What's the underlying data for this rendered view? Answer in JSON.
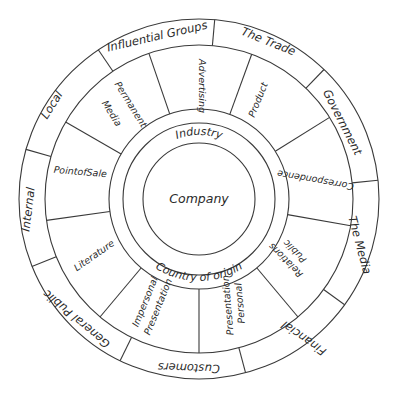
{
  "diagram": {
    "type": "concentric-wheel",
    "center": {
      "label": "Company"
    },
    "inner_ring": {
      "top_label": "Industry",
      "bottom_label": "Country of origin"
    },
    "middle_ring": {
      "segments": [
        {
          "label": "Advertising"
        },
        {
          "label": "Product"
        },
        {
          "label": "Correspondence"
        },
        {
          "label": "Public Relations"
        },
        {
          "label": "Personal Presentation"
        },
        {
          "label": "Impersonal Presentation"
        },
        {
          "label": "Literature"
        },
        {
          "label": "Point of Sale"
        },
        {
          "label": "Permanent Media"
        }
      ]
    },
    "outer_ring": {
      "segments": [
        {
          "label": "Influential Groups"
        },
        {
          "label": "The Trade"
        },
        {
          "label": "Government"
        },
        {
          "label": "The Media"
        },
        {
          "label": "Financial"
        },
        {
          "label": "Customers"
        },
        {
          "label": "General Public"
        },
        {
          "label": "Internal"
        },
        {
          "label": "Local"
        }
      ]
    }
  },
  "texts": {
    "company": "Company",
    "industry": "Industry",
    "country": "Country of origin",
    "advertising": "Advertising",
    "product": "Product",
    "correspondence": "Correspondence",
    "public": "Public",
    "relations": "Relations",
    "personal": "Personal",
    "presentation_a": "Presentation",
    "impersonal": "Impersonal",
    "presentation_b": "Presentation",
    "literature": "Literature",
    "point_of_sale": "PointofSale",
    "permanent": "Permanent",
    "media_word": "Media",
    "influential_groups": "Influential Groups",
    "the_trade": "The Trade",
    "government": "Government",
    "the_media": "The Media",
    "financial": "Financial",
    "customers": "Customers",
    "general_public": "General Public",
    "internal": "Internal",
    "local": "Local"
  },
  "colors": {
    "line": "#3a3a3a",
    "text": "#2a2a2a",
    "background": "#ffffff"
  }
}
